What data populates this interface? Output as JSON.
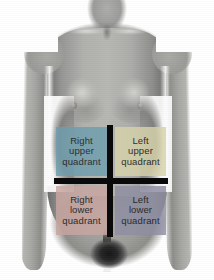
{
  "diagram": {
    "background_color": "#ffffff",
    "body_tone": "#a6a6a3"
  },
  "quadrants": {
    "divider_color": "#0a0a0a",
    "label_color": "#101010",
    "items": [
      {
        "id": "right-upper-quadrant",
        "abbr": "RUQ",
        "position": "top-left",
        "fill": "#6e9ead",
        "lines": [
          "Right",
          "upper",
          "quadrant"
        ]
      },
      {
        "id": "left-upper-quadrant",
        "abbr": "LUQ",
        "position": "top-right",
        "fill": "#d7d3ab",
        "lines": [
          "Left",
          "upper",
          "quadrant"
        ]
      },
      {
        "id": "right-lower-quadrant",
        "abbr": "RLQ",
        "position": "bottom-left",
        "fill": "#c9a6a1",
        "lines": [
          "Right",
          "lower",
          "quadrant"
        ]
      },
      {
        "id": "left-lower-quadrant",
        "abbr": "LLQ",
        "position": "bottom-right",
        "fill": "#8e8ea2",
        "lines": [
          "Left",
          "lower",
          "quadrant"
        ]
      }
    ]
  }
}
